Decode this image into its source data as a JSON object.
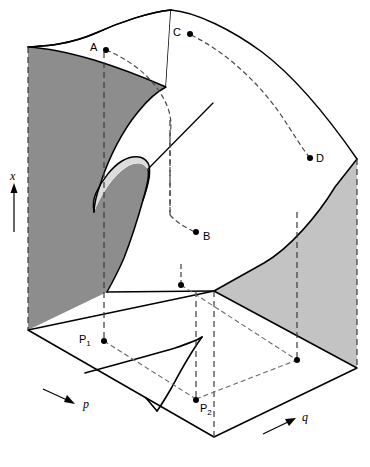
{
  "figure": {
    "type": "cusp-catastrophe-surface",
    "title": "",
    "axes": [
      {
        "id": "x",
        "label": "x",
        "orientation": "vertical",
        "arrow": "up"
      },
      {
        "id": "p",
        "label": "p",
        "orientation": "base-plane-left",
        "arrow": "right-down"
      },
      {
        "id": "q",
        "label": "q",
        "orientation": "base-plane-right",
        "arrow": "right-up"
      }
    ],
    "surface_points": [
      {
        "id": "A",
        "label": "A",
        "label_x": 90,
        "label_y": 42,
        "dot_x": 106,
        "dot_y": 50
      },
      {
        "id": "B",
        "label": "B",
        "label_x": 203,
        "label_y": 231,
        "dot_x": 196,
        "dot_y": 232
      },
      {
        "id": "C",
        "label": "C",
        "label_x": 173,
        "label_y": 27,
        "dot_x": 190,
        "dot_y": 34
      },
      {
        "id": "D",
        "label": "D",
        "label_x": 316,
        "label_y": 156,
        "dot_x": 310,
        "dot_y": 158
      }
    ],
    "plane_points": [
      {
        "id": "P1",
        "label": "P",
        "sub": "1",
        "label_x": 79,
        "label_y": 334,
        "dot_x": 104,
        "dot_y": 341
      },
      {
        "id": "P2",
        "label": "P",
        "sub": "2",
        "label_x": 200,
        "label_y": 406,
        "dot_x": 196,
        "dot_y": 400
      }
    ],
    "colors": {
      "stroke": "#000000",
      "surface_top": "#ffffff",
      "back_wall_dark": "#8d8d8d",
      "right_wall_light": "#c3c3c3",
      "fold_tongue_light": "#dcdcdc",
      "base_plane": "#ffffff",
      "dashed": "#555555"
    },
    "notes": {
      "grid": "off",
      "legend": "none"
    }
  }
}
